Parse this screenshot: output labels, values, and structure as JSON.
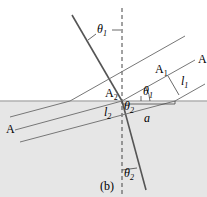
{
  "diagram": {
    "panel_label": "(b)",
    "labels": {
      "theta1_top": "θ",
      "theta1_top_sub": "1",
      "theta1_inner": "θ",
      "theta1_inner_sub": "1",
      "theta2_inner": "θ",
      "theta2_inner_sub": "2",
      "theta2_bottom": "θ",
      "theta2_bottom_sub": "2",
      "A1": "A",
      "A1_sub": "1",
      "A2": "A",
      "A2_sub": "2",
      "l1": "l",
      "l1_sub": "1",
      "l2": "l",
      "l2_sub": "2",
      "a": "a",
      "A_right": "A",
      "A_left": "A"
    },
    "colors": {
      "medium": "#e6e6e6",
      "surface": "#b0b0b0",
      "line": "#555555",
      "ray": "#666666"
    }
  }
}
